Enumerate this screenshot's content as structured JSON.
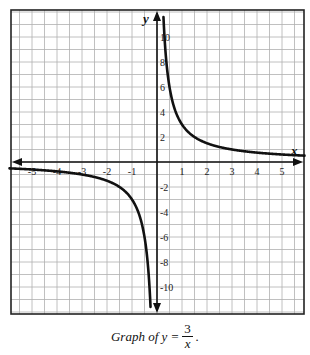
{
  "chart_data": {
    "type": "line",
    "function": "y = 3/x",
    "xlabel": "x",
    "ylabel": "y",
    "xlim": [
      -5.9,
      5.9
    ],
    "ylim": [
      -12.2,
      12.2
    ],
    "grid": true,
    "grid_step": {
      "x": 0.5,
      "y": 1
    },
    "x_ticks": [
      -5,
      -4,
      -3,
      -2,
      -1,
      1,
      2,
      3,
      4,
      5
    ],
    "y_ticks": [
      -10,
      -8,
      -6,
      -4,
      -2,
      2,
      4,
      6,
      8,
      10
    ],
    "series": [
      {
        "name": "y = 3/x (x > 0)",
        "x": [
          0.25,
          0.3,
          0.375,
          0.5,
          0.75,
          1,
          1.5,
          2,
          3,
          4,
          5,
          5.9
        ],
        "values": [
          12,
          10,
          8,
          6,
          4,
          3,
          2,
          1.5,
          1,
          0.75,
          0.6,
          0.51
        ]
      },
      {
        "name": "y = 3/x (x < 0)",
        "x": [
          -5.9,
          -5,
          -4,
          -3,
          -2,
          -1.5,
          -1,
          -0.75,
          -0.5,
          -0.375,
          -0.3,
          -0.25
        ],
        "values": [
          -0.51,
          -0.6,
          -0.75,
          -1,
          -1.5,
          -2,
          -3,
          -4,
          -6,
          -8,
          -10,
          -12
        ]
      }
    ]
  },
  "axis_labels": {
    "x": "x",
    "y": "y"
  },
  "caption": {
    "prefix": "Graph of y =",
    "numerator": "3",
    "denominator": "x",
    "suffix": "."
  },
  "colors": {
    "grid": "#b0b0b0",
    "axis": "#111111",
    "curve": "#111111",
    "frame": "#222222"
  }
}
